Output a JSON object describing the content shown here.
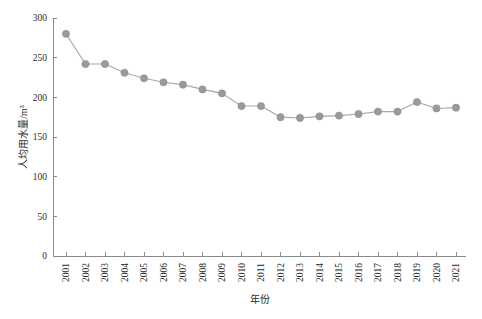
{
  "chart_data": {
    "type": "line",
    "title": "",
    "xlabel": "年份",
    "ylabel": "人均用水量/m³",
    "categories": [
      "2001",
      "2002",
      "2003",
      "2004",
      "2005",
      "2006",
      "2007",
      "2008",
      "2009",
      "2010",
      "2011",
      "2012",
      "2013",
      "2014",
      "2015",
      "2016",
      "2017",
      "2018",
      "2019",
      "2020",
      "2021"
    ],
    "values": [
      280,
      242,
      242,
      231,
      224,
      219,
      216,
      210,
      205,
      189,
      189,
      175,
      174,
      176,
      177,
      179,
      182,
      182,
      194,
      186,
      187
    ],
    "series": [
      {
        "name": "人均用水量",
        "values": [
          280,
          242,
          242,
          231,
          224,
          219,
          216,
          210,
          205,
          189,
          189,
          175,
          174,
          176,
          177,
          179,
          182,
          182,
          194,
          186,
          187
        ]
      }
    ],
    "xlim": [
      2000.5,
      2021.5
    ],
    "ylim": [
      0,
      300
    ],
    "y_ticks": [
      0,
      50,
      100,
      150,
      200,
      250,
      300
    ],
    "y_tick_labels": [
      "0",
      "50",
      "100",
      "150",
      "200",
      "250",
      "300"
    ],
    "x_tick_labels": [
      "2001",
      "2002",
      "2003",
      "2004",
      "2005",
      "2006",
      "2007",
      "2008",
      "2009",
      "2010",
      "2011",
      "2012",
      "2013",
      "2014",
      "2015",
      "2016",
      "2017",
      "2018",
      "2019",
      "2020",
      "2021"
    ],
    "x_tick_label_rotation": -90,
    "grid": false,
    "legend": null,
    "legend_position": "none",
    "marker": "circle",
    "marker_color": "#9a9a9a",
    "line_color": "#a8a8a8",
    "axis_color": "#8a8a8a",
    "background_color": "#ffffff",
    "annotations": []
  },
  "axis_titles": {
    "x": "年份",
    "y": "人均用水量/m³"
  },
  "footer": {
    "watermark": ""
  }
}
